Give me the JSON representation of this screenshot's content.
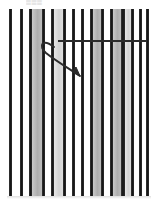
{
  "figure": {
    "title_fragment": "▒▒▒",
    "canvas": {
      "width": 158,
      "height": 208,
      "background": "#ffffff"
    },
    "field": {
      "left": 7,
      "top": 9,
      "right": 151,
      "bottom": 196,
      "description": "vertical-striped-grating"
    },
    "colors": {
      "dark_bar": "#1a1a1a",
      "mid_bar": "#4a4a4a",
      "gray_band": "#b5b5b5",
      "light_band": "#dcdcdc",
      "white_band": "#ffffff",
      "overlay_line": "#2b2b2b",
      "background": "#ffffff"
    },
    "stripes": [
      {
        "x": 7,
        "w": 2,
        "fill": "#ffffff"
      },
      {
        "x": 9,
        "w": 3,
        "fill": "#1a1a1a"
      },
      {
        "x": 12,
        "w": 8,
        "fill": "#ffffff"
      },
      {
        "x": 20,
        "w": 3,
        "fill": "#1a1a1a"
      },
      {
        "x": 23,
        "w": 6,
        "fill": "#ffffff"
      },
      {
        "x": 29,
        "w": 3,
        "fill": "#1a1a1a"
      },
      {
        "x": 32,
        "w": 10,
        "fill": "#b5b5b5"
      },
      {
        "x": 42,
        "w": 3,
        "fill": "#1a1a1a"
      },
      {
        "x": 45,
        "w": 6,
        "fill": "#ffffff"
      },
      {
        "x": 51,
        "w": 3,
        "fill": "#1a1a1a"
      },
      {
        "x": 54,
        "w": 9,
        "fill": "#dcdcdc"
      },
      {
        "x": 63,
        "w": 3,
        "fill": "#1a1a1a"
      },
      {
        "x": 66,
        "w": 6,
        "fill": "#ffffff"
      },
      {
        "x": 72,
        "w": 3,
        "fill": "#1a1a1a"
      },
      {
        "x": 75,
        "w": 6,
        "fill": "#ffffff"
      },
      {
        "x": 81,
        "w": 3,
        "fill": "#1a1a1a"
      },
      {
        "x": 84,
        "w": 6,
        "fill": "#ffffff"
      },
      {
        "x": 90,
        "w": 3,
        "fill": "#1a1a1a"
      },
      {
        "x": 93,
        "w": 8,
        "fill": "#b5b5b5"
      },
      {
        "x": 101,
        "w": 3,
        "fill": "#1a1a1a"
      },
      {
        "x": 104,
        "w": 6,
        "fill": "#ffffff"
      },
      {
        "x": 110,
        "w": 3,
        "fill": "#1a1a1a"
      },
      {
        "x": 113,
        "w": 8,
        "fill": "#b5b5b5"
      },
      {
        "x": 121,
        "w": 4,
        "fill": "#1a1a1a"
      },
      {
        "x": 125,
        "w": 6,
        "fill": "#dcdcdc"
      },
      {
        "x": 131,
        "w": 3,
        "fill": "#1a1a1a"
      },
      {
        "x": 134,
        "w": 5,
        "fill": "#ffffff"
      },
      {
        "x": 139,
        "w": 3,
        "fill": "#1a1a1a"
      },
      {
        "x": 142,
        "w": 4,
        "fill": "#ffffff"
      },
      {
        "x": 146,
        "w": 3,
        "fill": "#1a1a1a"
      },
      {
        "x": 149,
        "w": 2,
        "fill": "#ffffff"
      }
    ],
    "overlay": {
      "horizontal_line": {
        "x1": 58,
        "y1": 41,
        "x2": 147,
        "y2": 41,
        "stroke_width": 2
      },
      "curved_arrow": {
        "path": "M 54 47 C 42 38, 38 46, 46 53 C 56 61, 68 68, 80 76",
        "stroke_width": 2,
        "arrowhead": "M 80 76 L 72 72 L 76 67 Z",
        "direction": "down-right"
      }
    }
  }
}
